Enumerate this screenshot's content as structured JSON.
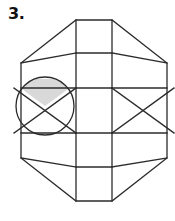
{
  "page": {
    "background_color": "#ffffff",
    "width": 175,
    "height": 221
  },
  "problem": {
    "number_label": "3.",
    "type": "geometric-figure-puzzle"
  },
  "figure": {
    "name": "shaded-hexagon-with-circle",
    "stroke_color": "#2b2b2b",
    "stroke_width": 1.3,
    "fill_color": "none",
    "shaded_color": "#d9d9d9",
    "shaded_region_label": "circle-top-wedge",
    "outer_shape": "hexagon",
    "hexagon_points": "76,20 112,20 167,63 167,158 112,201 76,201 21,158 21,63",
    "center_column": {
      "left_x": 76,
      "right_x": 112,
      "top_y": 20,
      "bottom_y": 201,
      "divider_rows": [
        53,
        88,
        133,
        167
      ]
    },
    "circle": {
      "cx": 45,
      "cy": 106,
      "r": 29
    },
    "left_panel": {
      "horizontal_lines_y": [
        88,
        133
      ],
      "diagonals": [
        "14,88 76,133",
        "14,133 76,88"
      ]
    },
    "right_panel": {
      "horizontal_lines_y": [
        88,
        133
      ],
      "diagonals": [
        "112,88 174,133",
        "112,133 174,88"
      ]
    },
    "top_wings": {
      "left_diagonal": "21,63 76,20",
      "right_diagonal": "112,20 167,63",
      "left_inner_diagonal": "21,63 76,53",
      "right_inner_diagonal": "112,53 167,63",
      "inner_chevron_left": "48,41 76,53",
      "inner_chevron_right": "112,53 140,41"
    },
    "bottom_wings": {
      "left_diagonal": "21,158 76,201",
      "right_diagonal": "112,201 167,158",
      "left_inner_diagonal": "21,158 76,167",
      "right_inner_diagonal": "112,167 167,158",
      "inner_chevron_left": "48,180 76,167",
      "inner_chevron_right": "112,167 140,180"
    }
  }
}
